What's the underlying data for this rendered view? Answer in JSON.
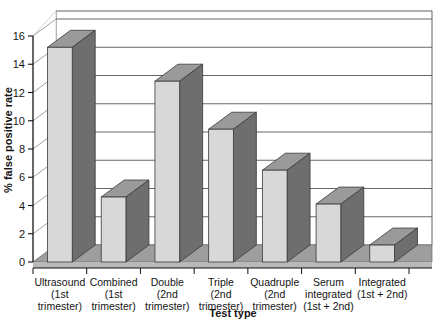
{
  "chart_data": {
    "type": "bar",
    "title": "",
    "subtitle": "",
    "xlabel": "Test type",
    "ylabel": "% false positive rate",
    "categories": [
      "Ultrasound (1st trimester)",
      "Combined (1st trimester)",
      "Double (2nd trimester)",
      "Triple (2nd trimester)",
      "Quadruple (2nd trimester)",
      "Serum integrated (1st + 2nd)",
      "Integrated (1st + 2nd)"
    ],
    "category_lines": [
      [
        "Ultrasound",
        "(1st",
        "trimester)"
      ],
      [
        "Combined",
        "(1st",
        "trimester)"
      ],
      [
        "Double",
        "(2nd",
        "trimester)"
      ],
      [
        "Triple",
        "(2nd",
        "trimester)"
      ],
      [
        "Quadruple",
        "(2nd",
        "trimester)"
      ],
      [
        "Serum",
        "integrated",
        "(1st + 2nd)"
      ],
      [
        "Integrated",
        "(1st + 2nd)",
        ""
      ]
    ],
    "values": [
      15.2,
      4.6,
      12.8,
      9.4,
      6.5,
      4.1,
      1.2
    ],
    "ylim": [
      0,
      16
    ],
    "yticks": [
      0,
      2,
      4,
      6,
      8,
      10,
      12,
      14,
      16
    ],
    "ytick_labels": [
      "0",
      "2",
      "4",
      "6",
      "8",
      "10",
      "12",
      "14",
      "16"
    ],
    "grid": true,
    "legend": null,
    "style": "3d-bar",
    "colors": {
      "bar_face": "#d8d8d8",
      "bar_side": "#6e6e6e",
      "bar_top": "#9a9a9a",
      "floor": "#9e9e9e",
      "wall": "#ffffff",
      "grid_line": "#555555",
      "axis_line": "#111111",
      "text": "#141414"
    }
  }
}
